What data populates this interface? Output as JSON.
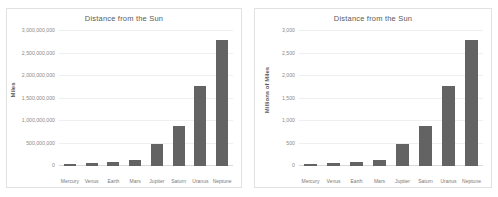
{
  "top_crop_text": "",
  "colors": {
    "bar": "#636363",
    "gridline": "#efefef",
    "axis": "#d9d9d9",
    "title_text": "#5a5a5a",
    "tick_text": "#8a8a8a",
    "background": "#ffffff",
    "chart_border": "#e2e2e2"
  },
  "charts": [
    {
      "title": "Distance from the Sun",
      "ylabel": "Miles",
      "ticks": [
        "3,000,000,000",
        "2,500,000,000",
        "2,000,000,000",
        "1,500,000,000",
        "1,000,000,000",
        "500,000,000",
        "0"
      ],
      "categories": [
        "Mercury",
        "Venus",
        "Earth",
        "Mars",
        "Jupiter",
        "Saturn",
        "Uranus",
        "Neptune"
      ]
    },
    {
      "title": "Distance from the Sun",
      "ylabel": "Millions of Miles",
      "ticks": [
        "3,000",
        "2,500",
        "2,000",
        "1,500",
        "1,000",
        "500",
        "0"
      ],
      "categories": [
        "Mercury",
        "Venus",
        "Earth",
        "Mars",
        "Jupiter",
        "Saturn",
        "Uranus",
        "Neptune"
      ]
    }
  ],
  "chart_data": [
    {
      "type": "bar",
      "title": "Distance from the Sun",
      "xlabel": "",
      "ylabel": "Miles",
      "categories": [
        "Mercury",
        "Venus",
        "Earth",
        "Mars",
        "Jupiter",
        "Saturn",
        "Uranus",
        "Neptune"
      ],
      "values": [
        36000000,
        67000000,
        93000000,
        142000000,
        484000000,
        887000000,
        1784000000,
        2795000000
      ],
      "ylim": [
        0,
        3000000000
      ],
      "ytick_values": [
        0,
        500000000,
        1000000000,
        1500000000,
        2000000000,
        2500000000,
        3000000000
      ],
      "ytick_labels": [
        "0",
        "500,000,000",
        "1,000,000,000",
        "1,500,000,000",
        "2,000,000,000",
        "2,500,000,000",
        "3,000,000,000"
      ],
      "grid": true,
      "legend": false,
      "series_color": "#636363"
    },
    {
      "type": "bar",
      "title": "Distance from the Sun",
      "xlabel": "",
      "ylabel": "Millions of Miles",
      "categories": [
        "Mercury",
        "Venus",
        "Earth",
        "Mars",
        "Jupiter",
        "Saturn",
        "Uranus",
        "Neptune"
      ],
      "values": [
        36,
        67,
        93,
        142,
        484,
        887,
        1784,
        2795
      ],
      "ylim": [
        0,
        3000
      ],
      "ytick_values": [
        0,
        500,
        1000,
        1500,
        2000,
        2500,
        3000
      ],
      "ytick_labels": [
        "0",
        "500",
        "1,000",
        "1,500",
        "2,000",
        "2,500",
        "3,000"
      ],
      "grid": true,
      "legend": false,
      "series_color": "#636363"
    }
  ]
}
